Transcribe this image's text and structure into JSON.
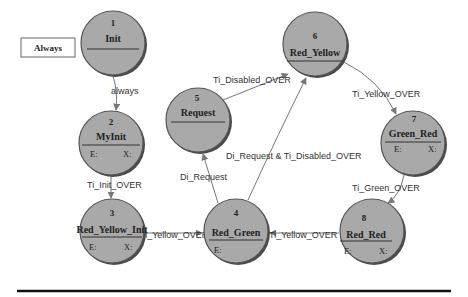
{
  "legend": {
    "label": "Always"
  },
  "nodes": [
    {
      "id": "1",
      "name": "Init",
      "entry": "",
      "exit": "",
      "cx": 113,
      "cy": 43
    },
    {
      "id": "2",
      "name": "MyInit",
      "entry": "E:",
      "exit": "X:",
      "cx": 111,
      "cy": 143
    },
    {
      "id": "3",
      "name": "Red_Yellow_Init",
      "entry": "E:",
      "exit": "X:",
      "cx": 112,
      "cy": 231
    },
    {
      "id": "4",
      "name": "Red_Green",
      "entry": "E:",
      "exit": "",
      "cx": 236,
      "cy": 231
    },
    {
      "id": "5",
      "name": "Request",
      "entry": "",
      "exit": "",
      "cx": 198,
      "cy": 120
    },
    {
      "id": "6",
      "name": "Red_Yellow",
      "entry": "",
      "exit": "",
      "cx": 315,
      "cy": 44
    },
    {
      "id": "7",
      "name": "Green_Red",
      "entry": "E:",
      "exit": "X:",
      "cx": 413,
      "cy": 143
    },
    {
      "id": "8",
      "name": "Red_Red",
      "entry": "E:",
      "exit": "X:",
      "cx": 372,
      "cy": 231
    }
  ],
  "edges": [
    {
      "from": "1",
      "to": "2",
      "label": "always"
    },
    {
      "from": "2",
      "to": "3",
      "label": "Ti_Init_OVER"
    },
    {
      "from": "3",
      "to": "4",
      "label": "Ti_Yellow_OVER"
    },
    {
      "from": "4",
      "to": "5",
      "label": "Di_Request"
    },
    {
      "from": "5",
      "to": "6",
      "label": "Ti_Disabled_OVER"
    },
    {
      "from": "4",
      "to": "6",
      "label": "Di_Request & Ti_Disabled_OVER"
    },
    {
      "from": "6",
      "to": "7",
      "label": "Ti_Yellow_OVER"
    },
    {
      "from": "7",
      "to": "8",
      "label": "Ti_Green_OVER"
    },
    {
      "from": "8",
      "to": "4",
      "label": "Ti_Yellow_OVER"
    }
  ]
}
